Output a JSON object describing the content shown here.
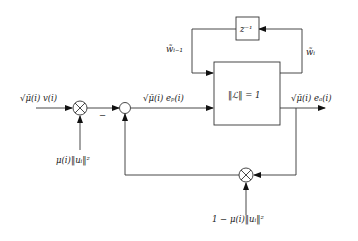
{
  "diagram": {
    "type": "block-diagram",
    "input_label": "√μ̄(i) v(i)",
    "multiplier_top_input_label": "μ(i)‖uᵢ‖²",
    "summing_junction_sign": "−",
    "error_label": "√μ̄(i) eₚ(i)",
    "main_block_label": "‖ℒ‖ = 1",
    "output_label": "√μ̄(i) eₐ(i)",
    "delay_block_label": "z⁻¹",
    "feedback_top_left_label": "w̃ᵢ₋₁",
    "feedback_top_right_label": "w̃ᵢ",
    "bottom_multiplier_input_label": "1 − μ(i)‖uᵢ‖²"
  }
}
